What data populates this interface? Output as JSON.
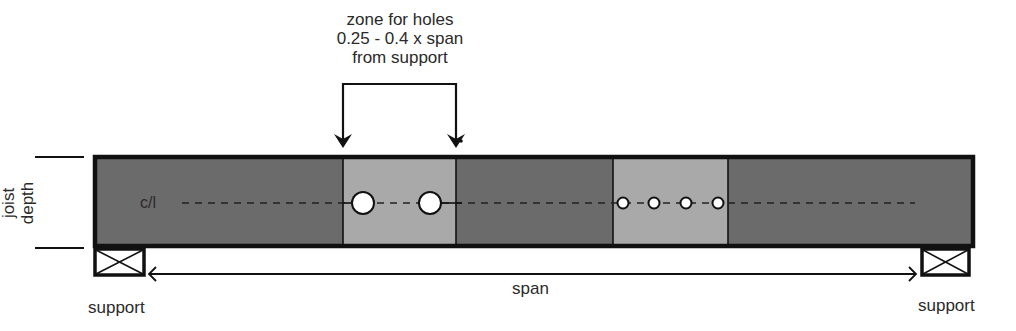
{
  "caption": {
    "line1": "zone for holes",
    "line2": "0.25 - 0.4 x span",
    "line3": "from support"
  },
  "labels": {
    "centerline": "c/l",
    "depth_line1": "joist",
    "depth_line2": "depth",
    "span": "span",
    "support_left": "support",
    "support_right": "support"
  },
  "colors": {
    "joist_fill": "#6b6b6b",
    "zone_fill": "#a9a9a9",
    "outline": "#111111",
    "hole_fill": "#ffffff"
  },
  "joist": {
    "x": 93,
    "y": 155,
    "width": 882,
    "height": 93
  },
  "zones": [
    {
      "name": "hole-zone-left",
      "x": 343,
      "width": 113
    },
    {
      "name": "hole-zone-right",
      "x": 613,
      "width": 115
    }
  ],
  "holes": [
    {
      "cx": 363,
      "cy": 203,
      "r": 11
    },
    {
      "cx": 430,
      "cy": 203,
      "r": 11
    },
    {
      "cx": 623,
      "cy": 203,
      "r": 5.5
    },
    {
      "cx": 654,
      "cy": 203,
      "r": 5.5
    },
    {
      "cx": 686,
      "cy": 203,
      "r": 5.5
    },
    {
      "cx": 718,
      "cy": 203,
      "r": 5.5
    }
  ],
  "supports": [
    {
      "name": "support-left",
      "x": 94,
      "y": 249,
      "width": 51,
      "height": 27
    },
    {
      "name": "support-right",
      "x": 921,
      "y": 249,
      "width": 49,
      "height": 27
    }
  ]
}
